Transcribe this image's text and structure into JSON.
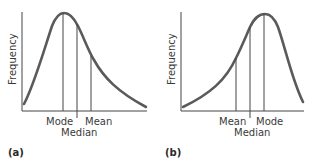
{
  "panels": [
    {
      "id": "a",
      "label": "(a)",
      "y_axis_label": "Frequency",
      "skew": "right",
      "markers": [
        {
          "name": "Mode",
          "label": "Mode"
        },
        {
          "name": "Median",
          "label": "Median"
        },
        {
          "name": "Mean",
          "label": "Mean"
        }
      ]
    },
    {
      "id": "b",
      "label": "(b)",
      "y_axis_label": "Frequency",
      "skew": "left",
      "markers": [
        {
          "name": "Mean",
          "label": "Mean"
        },
        {
          "name": "Median",
          "label": "Median"
        },
        {
          "name": "Mode",
          "label": "Mode"
        }
      ]
    }
  ],
  "colors": {
    "curve": "#5a5a5a",
    "axis": "#444444",
    "text": "#3a3a3a"
  }
}
